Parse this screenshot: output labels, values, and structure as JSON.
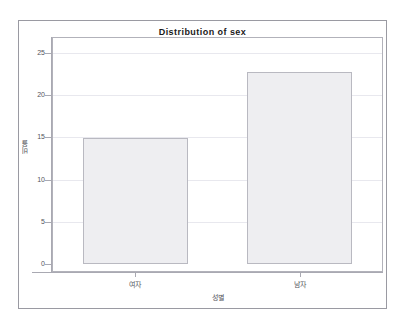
{
  "chart_data": {
    "type": "bar",
    "title": "Distribution of sex",
    "categories": [
      "여자",
      "남자"
    ],
    "values": [
      14.9,
      22.7
    ],
    "xlabel": "성별",
    "ylabel": "비율",
    "ylim": [
      0,
      25
    ],
    "yticks": [
      0,
      5,
      10,
      15,
      20,
      25
    ],
    "ytick_labels": [
      "0",
      "5",
      "10",
      "15",
      "20",
      "25"
    ],
    "grid": true,
    "legend": false,
    "legend_position": "none",
    "bar_fill_color": "#eeeef1",
    "bar_border_color": "#b9b9c1",
    "axis_color": "#a9a9b2",
    "grid_color": "#e8e8ee",
    "frame_color": "#9a9aa2",
    "title_color": "#1a1a1a",
    "text_color": "#55555c",
    "background_color": "#ffffff"
  }
}
